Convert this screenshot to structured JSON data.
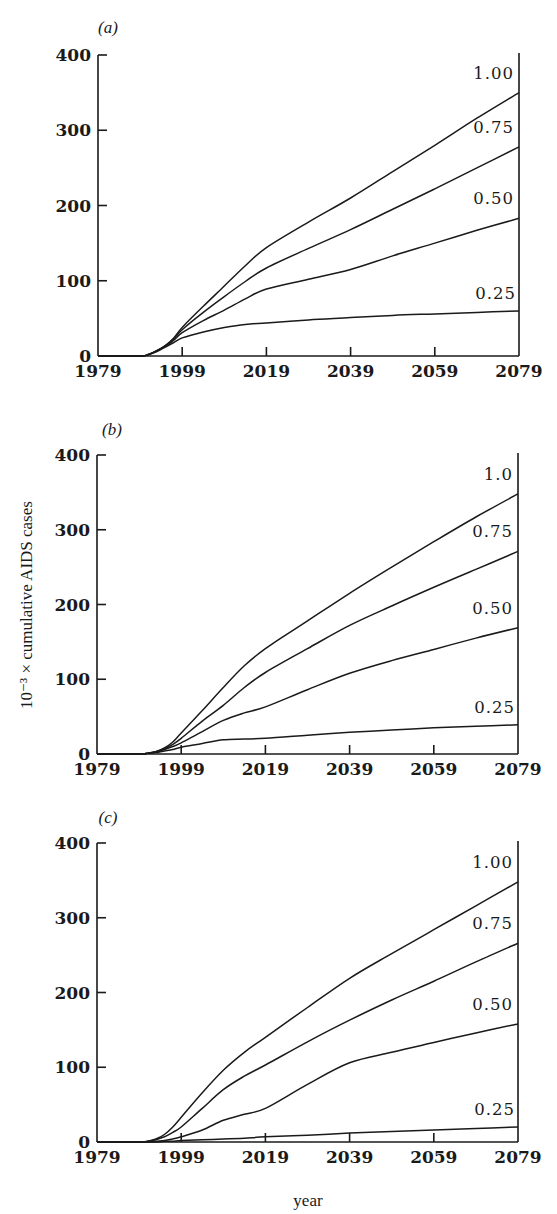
{
  "chart_data": {
    "type": "line",
    "shared": {
      "xlabel": "year",
      "ylabel": "10⁻³ × cumulative AIDS cases",
      "x_ticks": [
        1979,
        1999,
        2019,
        2039,
        2059,
        2079
      ],
      "y_ticks": [
        0,
        100,
        200,
        300,
        400
      ],
      "xlim": [
        1979,
        2079
      ],
      "ylim": [
        0,
        400
      ],
      "grid": false
    },
    "panels": [
      {
        "panel_label": "(a)",
        "x": [
          1979,
          1989,
          1991,
          1993,
          1995,
          1997,
          1999,
          2004,
          2009,
          2014,
          2019,
          2029,
          2039,
          2049,
          2059,
          2069,
          2079
        ],
        "series": [
          {
            "name": "1.00",
            "label": "1.00",
            "values": [
              0,
              0,
              2,
              7,
              14,
              24,
              38,
              66,
              93,
              120,
              144,
              178,
              210,
              245,
              280,
              316,
              350
            ]
          },
          {
            "name": "0.75",
            "label": "0.75",
            "values": [
              0,
              0,
              2,
              7,
              14,
              23,
              35,
              58,
              79,
              99,
              117,
              143,
              168,
              195,
              222,
              250,
              278
            ]
          },
          {
            "name": "0.50",
            "label": "0.50",
            "values": [
              0,
              0,
              2,
              7,
              13,
              21,
              31,
              47,
              61,
              76,
              89,
              102,
              115,
              133,
              150,
              167,
              183
            ]
          },
          {
            "name": "0.25",
            "label": "0.25",
            "values": [
              0,
              0,
              2,
              6,
              12,
              18,
              24,
              32,
              38,
              42,
              44,
              48,
              51,
              54,
              56,
              58,
              60
            ]
          }
        ]
      },
      {
        "panel_label": "(b)",
        "x": [
          1979,
          1989,
          1991,
          1993,
          1995,
          1997,
          1999,
          2004,
          2009,
          2014,
          2019,
          2029,
          2039,
          2049,
          2059,
          2069,
          2079
        ],
        "series": [
          {
            "name": "1.0",
            "label": "1.0",
            "values": [
              0,
              0,
              1,
              3,
              8,
              16,
              28,
              58,
              89,
              118,
              141,
              178,
              215,
              250,
              284,
              317,
              348
            ]
          },
          {
            "name": "0.75",
            "label": "0.75",
            "values": [
              0,
              0,
              1,
              3,
              7,
              13,
              21,
              44,
              65,
              89,
              109,
              141,
              172,
              198,
              223,
              247,
              271
            ]
          },
          {
            "name": "0.50",
            "label": "0.50",
            "values": [
              0,
              0,
              1,
              3,
              6,
              10,
              15,
              30,
              45,
              55,
              63,
              86,
              108,
              125,
              140,
              155,
              169
            ]
          },
          {
            "name": "0.25",
            "label": "0.25",
            "values": [
              0,
              0,
              1,
              2,
              4,
              6,
              9,
              14,
              19,
              20,
              21,
              25,
              29,
              32,
              35,
              37,
              39
            ]
          }
        ]
      },
      {
        "panel_label": "(c)",
        "x": [
          1979,
          1989,
          1991,
          1993,
          1995,
          1997,
          1999,
          2004,
          2009,
          2014,
          2019,
          2029,
          2039,
          2049,
          2059,
          2069,
          2079
        ],
        "series": [
          {
            "name": "1.00",
            "label": "1.00",
            "values": [
              0,
              0,
              1,
              4,
              10,
              20,
              33,
              66,
              96,
              120,
              140,
              180,
              219,
              252,
              284,
              316,
              348
            ]
          },
          {
            "name": "0.75",
            "label": "0.75",
            "values": [
              0,
              0,
              1,
              3,
              7,
              13,
              20,
              45,
              70,
              88,
              103,
              134,
              163,
              190,
              215,
              241,
              266
            ]
          },
          {
            "name": "0.50",
            "label": "0.50",
            "values": [
              0,
              0,
              0,
              1,
              2,
              4,
              7,
              16,
              29,
              37,
              45,
              77,
              106,
              120,
              133,
              146,
              158
            ]
          },
          {
            "name": "0.25",
            "label": "0.25",
            "values": [
              0,
              0,
              0,
              0,
              1,
              1,
              2,
              3,
              4,
              5,
              7,
              9,
              12,
              14,
              16,
              18,
              20
            ]
          }
        ]
      }
    ]
  }
}
